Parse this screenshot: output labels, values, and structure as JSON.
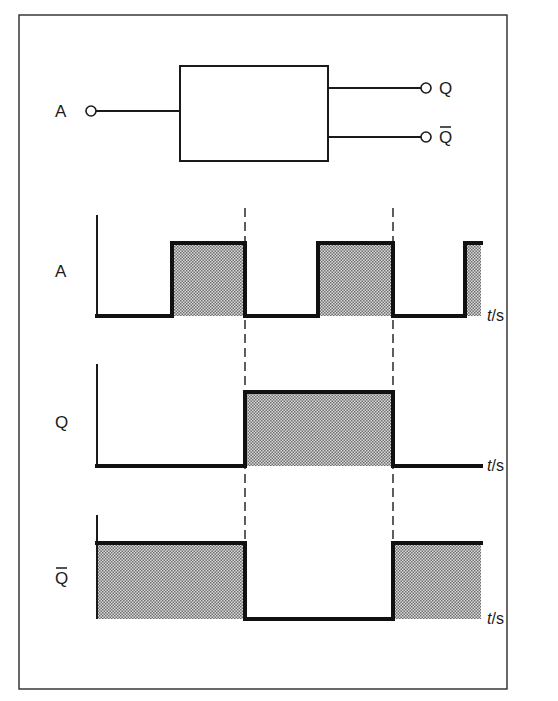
{
  "figure": {
    "frame": {
      "x": 19,
      "y": 15,
      "width": 488,
      "height": 674
    },
    "colors": {
      "ink": "#1a1a1a",
      "shade_dark": "#7a7a7a",
      "shade_light": "#d4d4d4",
      "background": "#ffffff"
    }
  },
  "gate": {
    "box": {
      "x": 180,
      "y": 66,
      "width": 148,
      "height": 95
    },
    "input": {
      "label": "A",
      "terminal_x": 91,
      "y": 111
    },
    "outputs": [
      {
        "label": "Q",
        "overbar": false,
        "y": 88,
        "terminal_x": 426
      },
      {
        "label": "Q",
        "overbar": true,
        "y": 137,
        "terminal_x": 426
      }
    ]
  },
  "timing": {
    "axis_x": 97,
    "end_x": 481,
    "dashed_lines": [
      {
        "x": 245,
        "y1": 208,
        "y2": 620
      },
      {
        "x": 393,
        "y1": 208,
        "y2": 620
      }
    ],
    "time_axis_label": {
      "t": "t",
      "slash_unit": "/s"
    },
    "signals": [
      {
        "name": "A",
        "overbar": false,
        "axis_top": 215,
        "low_y": 316,
        "high_y": 243,
        "label_y": 283,
        "segments": [
          {
            "x1": 97,
            "x2": 172,
            "level": 0
          },
          {
            "x1": 172,
            "x2": 245,
            "level": 1
          },
          {
            "x1": 245,
            "x2": 318,
            "level": 0
          },
          {
            "x1": 318,
            "x2": 393,
            "level": 1
          },
          {
            "x1": 393,
            "x2": 465,
            "level": 0
          },
          {
            "x1": 465,
            "x2": 481,
            "level": 1
          }
        ]
      },
      {
        "name": "Q",
        "overbar": false,
        "axis_top": 364,
        "low_y": 466,
        "high_y": 392,
        "label_y": 434,
        "segments": [
          {
            "x1": 97,
            "x2": 245,
            "level": 0
          },
          {
            "x1": 245,
            "x2": 393,
            "level": 1
          },
          {
            "x1": 393,
            "x2": 481,
            "level": 0
          }
        ]
      },
      {
        "name": "Q",
        "overbar": true,
        "axis_top": 515,
        "low_y": 619,
        "high_y": 543,
        "label_y": 590,
        "segments": [
          {
            "x1": 97,
            "x2": 245,
            "level": 1
          },
          {
            "x1": 245,
            "x2": 393,
            "level": 0
          },
          {
            "x1": 393,
            "x2": 481,
            "level": 1
          }
        ]
      }
    ]
  }
}
